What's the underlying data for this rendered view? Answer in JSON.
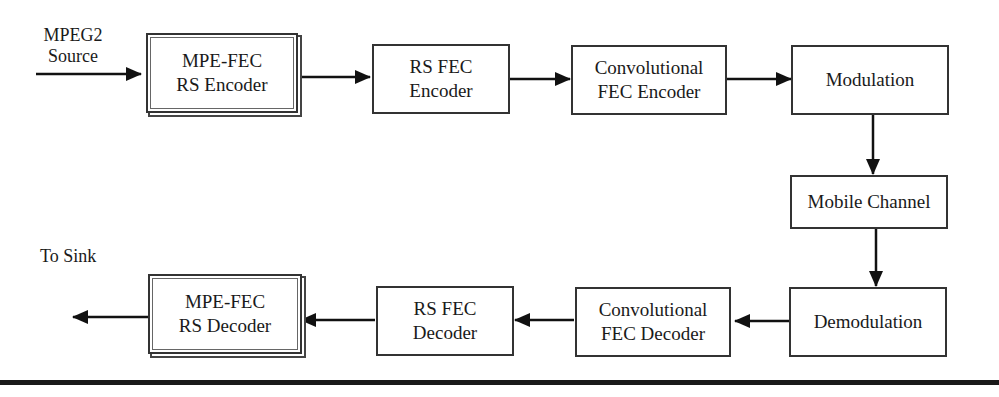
{
  "diagram": {
    "type": "block-flow",
    "input_label": {
      "line1": "MPEG2",
      "line2": "Source"
    },
    "output_label": "To Sink",
    "encoder_chain": [
      {
        "id": "mpe-fec-rs-encoder",
        "line1": "MPE-FEC",
        "line2": "RS Encoder",
        "style": "double-border"
      },
      {
        "id": "rs-fec-encoder",
        "line1": "RS FEC",
        "line2": "Encoder",
        "style": "single-border"
      },
      {
        "id": "convolutional-fec-encoder",
        "line1": "Convolutional",
        "line2": "FEC Encoder",
        "style": "single-border"
      },
      {
        "id": "modulation",
        "line1": "Modulation",
        "line2": "",
        "style": "single-border"
      }
    ],
    "channel": {
      "id": "mobile-channel",
      "label": "Mobile Channel"
    },
    "decoder_chain": [
      {
        "id": "demodulation",
        "line1": "Demodulation",
        "line2": "",
        "style": "single-border"
      },
      {
        "id": "convolutional-fec-decoder",
        "line1": "Convolutional",
        "line2": "FEC Decoder",
        "style": "single-border"
      },
      {
        "id": "rs-fec-decoder",
        "line1": "RS FEC",
        "line2": "Decoder",
        "style": "single-border"
      },
      {
        "id": "mpe-fec-rs-decoder",
        "line1": "MPE-FEC",
        "line2": "RS Decoder",
        "style": "double-border"
      }
    ],
    "edges": [
      [
        "MPEG2 Source",
        "MPE-FEC RS Encoder"
      ],
      [
        "MPE-FEC RS Encoder",
        "RS FEC Encoder"
      ],
      [
        "RS FEC Encoder",
        "Convolutional FEC Encoder"
      ],
      [
        "Convolutional FEC Encoder",
        "Modulation"
      ],
      [
        "Modulation",
        "Mobile Channel"
      ],
      [
        "Mobile Channel",
        "Demodulation"
      ],
      [
        "Demodulation",
        "Convolutional FEC Decoder"
      ],
      [
        "Convolutional FEC Decoder",
        "RS FEC Decoder"
      ],
      [
        "RS FEC Decoder",
        "MPE-FEC RS Decoder"
      ],
      [
        "MPE-FEC RS Decoder",
        "To Sink"
      ]
    ]
  }
}
